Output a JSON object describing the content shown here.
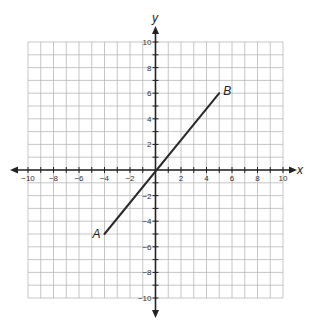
{
  "chart_data": {
    "type": "line",
    "title": "",
    "xlabel": "x",
    "ylabel": "y",
    "xlim": [
      -10,
      10
    ],
    "ylim": [
      -10,
      10
    ],
    "grid": true,
    "grid_step": 1,
    "x_ticks": [
      -10,
      -8,
      -6,
      -4,
      -2,
      2,
      4,
      6,
      8,
      10
    ],
    "y_ticks": [
      10,
      8,
      6,
      4,
      2,
      -2,
      -4,
      -6,
      -8,
      -10
    ],
    "x_tick_labels": [
      "−10",
      "−8",
      "−6",
      "−4",
      "−2",
      "2",
      "4",
      "6",
      "8",
      "10"
    ],
    "y_tick_labels": [
      "10",
      "8",
      "6",
      "4",
      "2",
      "−2",
      "−4",
      "−6",
      "−8",
      "−10"
    ],
    "series": [
      {
        "name": "segment AB",
        "points": [
          {
            "label": "A",
            "x": -4,
            "y": -5
          },
          {
            "label": "B",
            "x": 5,
            "y": 6
          }
        ]
      }
    ],
    "annotations": [
      {
        "text": "A",
        "x": -4,
        "y": -5
      },
      {
        "text": "B",
        "x": 5,
        "y": 6
      }
    ]
  },
  "axes": {
    "x_label": "x",
    "y_label": "y"
  },
  "colors": {
    "grid": "#b8b8b8",
    "axis": "#222222",
    "segment": "#2a2a2a"
  }
}
